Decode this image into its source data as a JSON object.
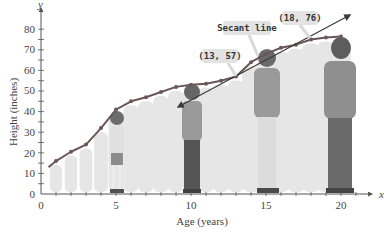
{
  "chart_data": {
    "type": "line",
    "title": "",
    "xlabel": "Age (years)",
    "ylabel": "Height (inches)",
    "x_var": "x",
    "y_var": "y",
    "xlim": [
      0,
      21
    ],
    "ylim": [
      0,
      85
    ],
    "x_ticks": [
      0,
      5,
      10,
      15,
      20
    ],
    "y_ticks": [
      0,
      10,
      20,
      30,
      40,
      50,
      60,
      70,
      80
    ],
    "grid": false,
    "series": [
      {
        "name": "Height vs age",
        "x": [
          0.5,
          1,
          2,
          3,
          4,
          5,
          6,
          7,
          8,
          9,
          10,
          11,
          12,
          13,
          14,
          15,
          16,
          17,
          18,
          19,
          20
        ],
        "values": [
          13,
          16,
          20.5,
          24,
          32,
          41,
          45,
          47,
          49.5,
          52,
          53,
          53.5,
          55,
          57,
          64,
          68,
          71,
          72.5,
          75,
          76,
          76.5
        ]
      }
    ],
    "secant_line": {
      "label": "Secant line",
      "points": [
        {
          "x": 13,
          "y": 57
        },
        {
          "x": 18,
          "y": 76
        }
      ],
      "slope": 3.8
    },
    "annotations": [
      {
        "text": "(13, 57)",
        "x": 13,
        "y": 57
      },
      {
        "text": "(18, 76)",
        "x": 18,
        "y": 76
      },
      {
        "text": "Secant line"
      }
    ],
    "colors": {
      "curve": "#6b5757",
      "secant": "#3a3a3a",
      "callout_bg": "#e3e3e3",
      "silhouette": "#e6e6e6"
    }
  },
  "labels": {
    "xlabel": "Age (years)",
    "ylabel": "Height (inches)",
    "x_var": "x",
    "y_var": "y",
    "callout_13": "(13, 57)",
    "callout_18": "(18, 76)",
    "callout_secant": "Secant line",
    "xtick_0": "0",
    "xtick_5": "5",
    "xtick_10": "10",
    "xtick_15": "15",
    "xtick_20": "20",
    "ytick_0": "0",
    "ytick_10": "10",
    "ytick_20": "20",
    "ytick_30": "30",
    "ytick_40": "40",
    "ytick_50": "50",
    "ytick_60": "60",
    "ytick_70": "70",
    "ytick_80": "80"
  }
}
